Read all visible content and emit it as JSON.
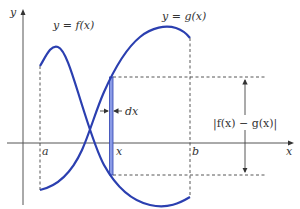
{
  "diagram": {
    "axes": {
      "x_label": "x",
      "y_label": "y"
    },
    "curves": [
      {
        "name": "f",
        "label": "y = f(x)"
      },
      {
        "name": "g",
        "label": "y = g(x)"
      }
    ],
    "interval": {
      "left_label": "a",
      "right_label": "b"
    },
    "strip": {
      "position_label": "x",
      "width_label": "dx"
    },
    "height_label": "|f(x) − g(x)|",
    "colors": {
      "curve": "#2b3fb0",
      "strip_fill": "#8a9be6",
      "axis": "#555555"
    }
  }
}
